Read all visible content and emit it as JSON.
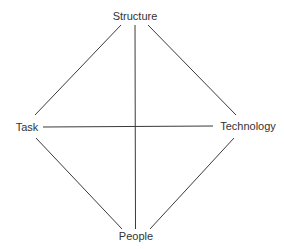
{
  "diagram": {
    "line_color": "#3a3a3a",
    "text_color": "#333333",
    "nodes": [
      {
        "id": "structure",
        "label": "Structure",
        "x": 135,
        "y": 16
      },
      {
        "id": "task",
        "label": "Task",
        "x": 27,
        "y": 127
      },
      {
        "id": "technology",
        "label": "Technology",
        "x": 248,
        "y": 126
      },
      {
        "id": "people",
        "label": "People",
        "x": 136,
        "y": 236
      }
    ],
    "edges": [
      {
        "from": "structure",
        "to": "task"
      },
      {
        "from": "structure",
        "to": "technology"
      },
      {
        "from": "structure",
        "to": "people"
      },
      {
        "from": "task",
        "to": "technology"
      },
      {
        "from": "task",
        "to": "people"
      },
      {
        "from": "technology",
        "to": "people"
      }
    ]
  }
}
